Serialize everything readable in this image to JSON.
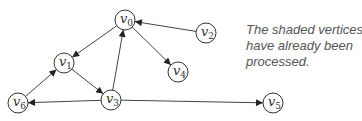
{
  "graph": {
    "nodes": [
      {
        "id": "v0",
        "label": "v",
        "sub": "0",
        "x": 125,
        "y": 20
      },
      {
        "id": "v1",
        "label": "v",
        "sub": "1",
        "x": 64,
        "y": 63
      },
      {
        "id": "v2",
        "label": "v",
        "sub": "2",
        "x": 206,
        "y": 33
      },
      {
        "id": "v3",
        "label": "v",
        "sub": "3",
        "x": 111,
        "y": 100
      },
      {
        "id": "v4",
        "label": "v",
        "sub": "4",
        "x": 178,
        "y": 72
      },
      {
        "id": "v5",
        "label": "v",
        "sub": "5",
        "x": 273,
        "y": 103
      },
      {
        "id": "v6",
        "label": "v",
        "sub": "6",
        "x": 18,
        "y": 103
      }
    ],
    "edges": [
      {
        "from": "v0",
        "to": "v1"
      },
      {
        "from": "v0",
        "to": "v4"
      },
      {
        "from": "v2",
        "to": "v0"
      },
      {
        "from": "v1",
        "to": "v3"
      },
      {
        "from": "v3",
        "to": "v0"
      },
      {
        "from": "v3",
        "to": "v6"
      },
      {
        "from": "v3",
        "to": "v5"
      },
      {
        "from": "v6",
        "to": "v1"
      }
    ],
    "node_radius": 10
  },
  "caption": {
    "lines": [
      "The shaded vertices",
      "have already been",
      "processed."
    ]
  }
}
